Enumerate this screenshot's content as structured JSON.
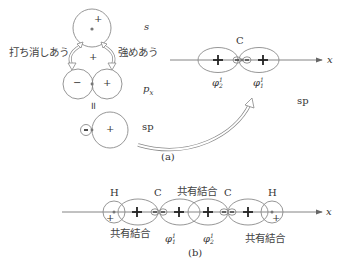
{
  "panel_a": {
    "caption": "(a)",
    "s_label": "s",
    "px_label": "p",
    "px_sub": "x",
    "sp_label": "sp",
    "sp_label_right": "sp",
    "cancel_label": "打ち消しあう",
    "reinforce_label": "強めあう",
    "equals_symbol": "॥",
    "plus": "+",
    "minus": "−",
    "carbon_label": "C",
    "axis_label": "x",
    "phi_left": "φ",
    "phi_left_sup": "1",
    "phi_left_sub": "2",
    "phi_right": "φ",
    "phi_right_sup": "1",
    "phi_right_sub": "1"
  },
  "panel_b": {
    "caption": "(b)",
    "atoms": [
      "H",
      "C",
      "C",
      "H"
    ],
    "bond_top": "共有結合",
    "bond_left": "共有結合",
    "bond_right": "共有結合",
    "phi1": "φ",
    "phi1_sup": "1",
    "phi1_sub": "1",
    "phi2": "φ",
    "phi2_sup": "1",
    "phi2_sub": "2",
    "axis_label": "x"
  },
  "colors": {
    "line": "#8a8a8a",
    "text": "#333333",
    "bold": "#222222"
  }
}
